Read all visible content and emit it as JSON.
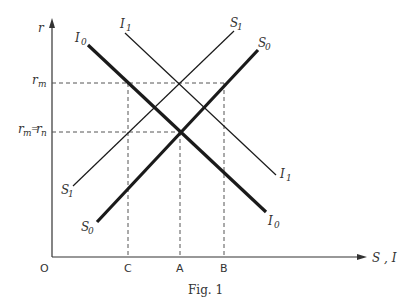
{
  "figure": {
    "caption": "Fig. 1",
    "axes": {
      "y_label": "r",
      "x_label": "S , I",
      "origin_label": "O"
    },
    "y_ticks": [
      {
        "label_main": "r",
        "label_sub": "m",
        "text": "r_m"
      },
      {
        "label_main": "r",
        "label_sub": "m",
        "label_eq": "=",
        "label_main2": "r",
        "label_sub2": "n",
        "text": "r_m = r_n"
      }
    ],
    "x_ticks": [
      "C",
      "A",
      "B"
    ],
    "curves": [
      {
        "name": "I0",
        "main": "I",
        "sub": "0",
        "type": "investment",
        "weight": "thick",
        "start_label": "I0",
        "end_label": "I0"
      },
      {
        "name": "I1",
        "main": "I",
        "sub": "1",
        "type": "investment",
        "weight": "thin",
        "start_label": "I1",
        "end_label": "I1"
      },
      {
        "name": "S0",
        "main": "S",
        "sub": "0",
        "type": "saving",
        "weight": "thick",
        "start_label": "S0",
        "end_label": "S0"
      },
      {
        "name": "S1",
        "main": "S",
        "sub": "1",
        "type": "saving",
        "weight": "thin",
        "start_label": "S1",
        "end_label": "S1"
      }
    ],
    "colors": {
      "line": "#1a1a1a",
      "dashed": "#555555",
      "text": "#333333",
      "background": "#ffffff"
    }
  }
}
